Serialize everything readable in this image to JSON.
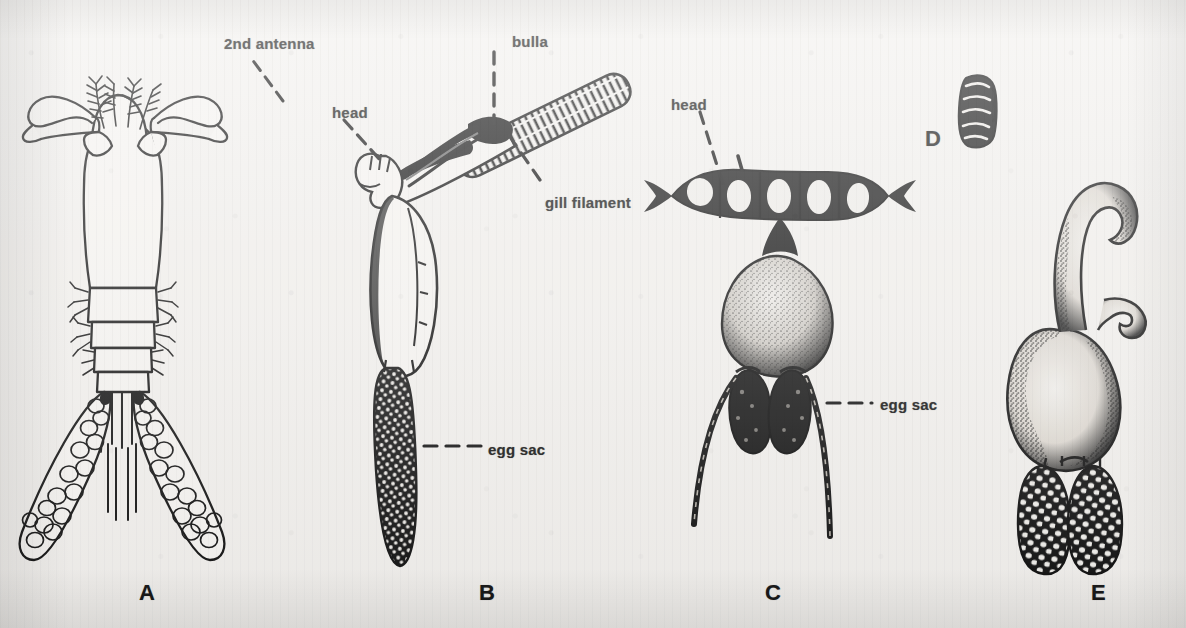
{
  "figure": {
    "background_color": "#f3f1ee",
    "ink_color": "#101010",
    "caption_letters": [
      {
        "letter": "A",
        "x": 139,
        "y": 580
      },
      {
        "letter": "B",
        "x": 479,
        "y": 580
      },
      {
        "letter": "C",
        "x": 765,
        "y": 580
      },
      {
        "letter": "D",
        "x": 925,
        "y": 126
      },
      {
        "letter": "E",
        "x": 1091,
        "y": 580
      }
    ],
    "annotations": [
      {
        "id": "second-antenna",
        "text": "2nd antenna",
        "x": 224,
        "y": 35,
        "panel": "A"
      },
      {
        "id": "head-b",
        "text": "head",
        "x": 332,
        "y": 104,
        "panel": "B"
      },
      {
        "id": "bulla",
        "text": "bulla",
        "x": 512,
        "y": 33,
        "panel": "B"
      },
      {
        "id": "gill-filament",
        "text": "gill filament",
        "x": 545,
        "y": 194,
        "panel": "B"
      },
      {
        "id": "egg-sac-b",
        "text": "egg sac",
        "x": 488,
        "y": 441,
        "panel": "B"
      },
      {
        "id": "head-c",
        "text": "head",
        "x": 671,
        "y": 96,
        "panel": "C"
      },
      {
        "id": "egg-sac-c",
        "text": "egg sac",
        "x": 880,
        "y": 396,
        "panel": "C"
      }
    ],
    "specimens": [
      {
        "id": "specimen-a",
        "letter": "A",
        "description": "outline drawing of free-swimming copepod with hooked second antennae, segmented abdomen and paired egg sacs"
      },
      {
        "id": "specimen-b",
        "letter": "B",
        "description": "copepod attached by bulla to a hatched gill filament, with elongate dark egg sac"
      },
      {
        "id": "specimen-c",
        "letter": "C",
        "description": "copepod with broad dark segmented head, stippled trunk and two dark egg sacs with long trailing strings"
      },
      {
        "id": "specimen-d",
        "letter": "D",
        "description": "small dark banded segmented body"
      },
      {
        "id": "specimen-e",
        "letter": "E",
        "description": "pear-shaped body with curved hook-like neck and two dark egg sacs with pale ova"
      }
    ]
  }
}
